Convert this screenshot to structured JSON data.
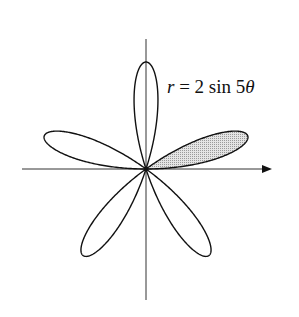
{
  "chart_data": {
    "type": "line",
    "subtype": "polar-rose",
    "title": "",
    "equation_label": "r = 2 sin 5θ",
    "equation": {
      "lhs": "r",
      "eq": "=",
      "coef": "2",
      "func": "sin",
      "freq": "5",
      "var": "θ"
    },
    "amplitude": 2,
    "frequency": 5,
    "petals": 5,
    "theta_range": [
      0,
      3.14159265
    ],
    "shaded_petal": {
      "theta_start": 0,
      "theta_end": 0.6283185,
      "fill": "#d6d6d6"
    },
    "axes": {
      "x_arrow": true,
      "y_arrow": false,
      "ticks": false,
      "grid": false
    },
    "xlabel": "",
    "ylabel": "",
    "colors": {
      "curve": "#111111",
      "axis": "#333333",
      "shade": "#d6d6d6",
      "background": "#ffffff"
    }
  },
  "label": {
    "r": "r",
    "eq": " = 2 sin 5",
    "theta": "θ"
  }
}
